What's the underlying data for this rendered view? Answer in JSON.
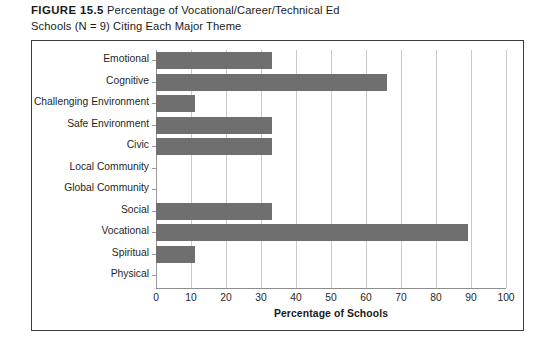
{
  "figure": {
    "label": "FIGURE 15.5",
    "caption": "Percentage of Vocational/Career/Technical Ed Schools (N = 9) Citing Each Major Theme"
  },
  "colors": {
    "bar": "#6f6f6f",
    "gridline": "#c9c9c9",
    "axis": "#8d8d8d",
    "frame": "#3b3b3b",
    "text": "#1f1f1f",
    "background": "#ffffff"
  },
  "chart_data": {
    "type": "bar",
    "orientation": "horizontal",
    "title": "Percentage of Vocational/Career/Technical Ed Schools (N = 9) Citing Each Major Theme",
    "xlabel": "Percentage of Schools",
    "ylabel": "",
    "xlim": [
      0,
      100
    ],
    "xticks": [
      0,
      10,
      20,
      30,
      40,
      50,
      60,
      70,
      80,
      90,
      100
    ],
    "xtick_labels": [
      "0",
      "10",
      "20",
      "30",
      "40",
      "50",
      "60",
      "70",
      "80",
      "90",
      "100"
    ],
    "grid": "vertical",
    "legend": "none",
    "categories": [
      "Emotional",
      "Cognitive",
      "Challenging Environment",
      "Safe Environment",
      "Civic",
      "Local Community",
      "Global Community",
      "Social",
      "Vocational",
      "Spiritual",
      "Physical"
    ],
    "values": [
      33,
      66,
      11,
      33,
      33,
      0,
      0,
      33,
      89,
      11,
      0
    ]
  }
}
